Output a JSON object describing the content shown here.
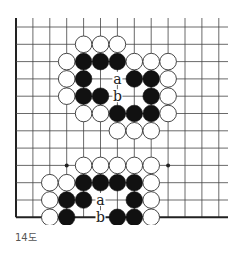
{
  "diagram": {
    "caption": "14도",
    "colors": {
      "background": "#ffffff",
      "line": "#444444",
      "edge": "#222222",
      "black_stone": "#111111",
      "white_stone_fill": "#ffffff",
      "white_stone_stroke": "#333333",
      "label": "#222222"
    },
    "grid": {
      "origin_x": 16,
      "origin_y": 27,
      "spacing_x": 16.9,
      "spacing_y": 17.3,
      "columns": 13,
      "rows": 12,
      "line_top": 18,
      "line_right": 228,
      "edges": [
        "left",
        "bottom"
      ],
      "stone_radius": 8.3
    },
    "star_points": [
      {
        "col": 3,
        "row": 8
      },
      {
        "col": 9,
        "row": 8
      }
    ],
    "stones": [
      {
        "color": "white",
        "col": 4,
        "row": 1
      },
      {
        "color": "white",
        "col": 5,
        "row": 1
      },
      {
        "color": "white",
        "col": 6,
        "row": 1
      },
      {
        "color": "white",
        "col": 3,
        "row": 2
      },
      {
        "color": "black",
        "col": 4,
        "row": 2
      },
      {
        "color": "black",
        "col": 5,
        "row": 2
      },
      {
        "color": "black",
        "col": 6,
        "row": 2
      },
      {
        "color": "white",
        "col": 7,
        "row": 2
      },
      {
        "color": "white",
        "col": 8,
        "row": 2
      },
      {
        "color": "white",
        "col": 9,
        "row": 2
      },
      {
        "color": "white",
        "col": 3,
        "row": 3
      },
      {
        "color": "black",
        "col": 4,
        "row": 3
      },
      {
        "color": "black",
        "col": 7,
        "row": 3
      },
      {
        "color": "black",
        "col": 8,
        "row": 3
      },
      {
        "color": "white",
        "col": 9,
        "row": 3
      },
      {
        "color": "white",
        "col": 3,
        "row": 4
      },
      {
        "color": "black",
        "col": 4,
        "row": 4
      },
      {
        "color": "black",
        "col": 5,
        "row": 4
      },
      {
        "color": "black",
        "col": 8,
        "row": 4
      },
      {
        "color": "white",
        "col": 9,
        "row": 4
      },
      {
        "color": "white",
        "col": 4,
        "row": 5
      },
      {
        "color": "white",
        "col": 5,
        "row": 5
      },
      {
        "color": "black",
        "col": 6,
        "row": 5
      },
      {
        "color": "black",
        "col": 7,
        "row": 5
      },
      {
        "color": "black",
        "col": 8,
        "row": 5
      },
      {
        "color": "white",
        "col": 9,
        "row": 5
      },
      {
        "color": "white",
        "col": 6,
        "row": 6
      },
      {
        "color": "white",
        "col": 7,
        "row": 6
      },
      {
        "color": "white",
        "col": 8,
        "row": 6
      },
      {
        "color": "white",
        "col": 4,
        "row": 8
      },
      {
        "color": "white",
        "col": 5,
        "row": 8
      },
      {
        "color": "white",
        "col": 6,
        "row": 8
      },
      {
        "color": "white",
        "col": 7,
        "row": 8
      },
      {
        "color": "white",
        "col": 8,
        "row": 8
      },
      {
        "color": "white",
        "col": 2,
        "row": 9
      },
      {
        "color": "white",
        "col": 3,
        "row": 9
      },
      {
        "color": "black",
        "col": 4,
        "row": 9
      },
      {
        "color": "black",
        "col": 5,
        "row": 9
      },
      {
        "color": "black",
        "col": 6,
        "row": 9
      },
      {
        "color": "black",
        "col": 7,
        "row": 9
      },
      {
        "color": "white",
        "col": 8,
        "row": 9
      },
      {
        "color": "white",
        "col": 2,
        "row": 10
      },
      {
        "color": "black",
        "col": 3,
        "row": 10
      },
      {
        "color": "black",
        "col": 4,
        "row": 10
      },
      {
        "color": "black",
        "col": 7,
        "row": 10
      },
      {
        "color": "white",
        "col": 8,
        "row": 10
      },
      {
        "color": "white",
        "col": 2,
        "row": 11
      },
      {
        "color": "black",
        "col": 3,
        "row": 11
      },
      {
        "color": "black",
        "col": 6,
        "row": 11
      },
      {
        "color": "black",
        "col": 7,
        "row": 11
      },
      {
        "color": "white",
        "col": 8,
        "row": 11
      }
    ],
    "labels": [
      {
        "text": "a",
        "col": 6,
        "row": 3
      },
      {
        "text": "b",
        "col": 6,
        "row": 4
      },
      {
        "text": "a",
        "col": 5,
        "row": 10
      },
      {
        "text": "b",
        "col": 5,
        "row": 11
      }
    ]
  }
}
